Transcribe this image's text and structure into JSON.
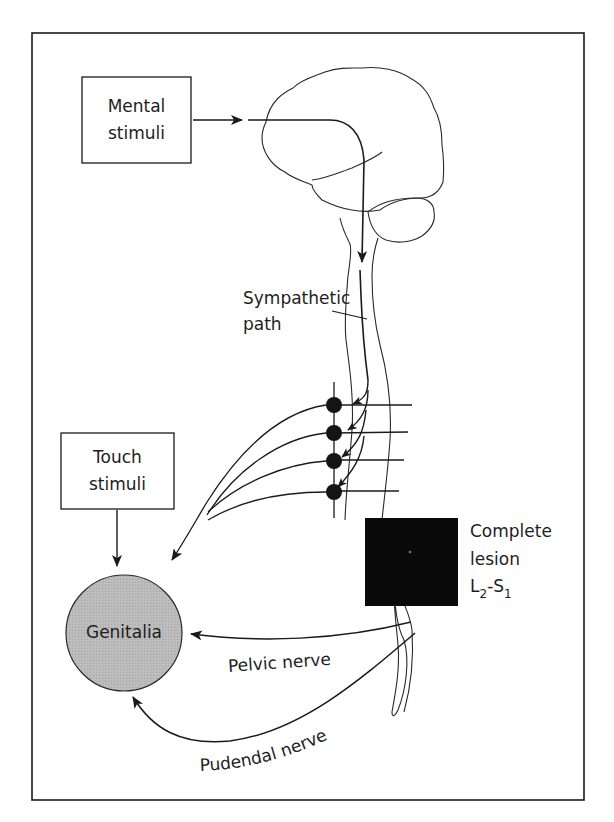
{
  "diagram": {
    "type": "neural-pathway-flow",
    "frame": {
      "x": 32,
      "y": 33,
      "width": 552,
      "height": 767
    },
    "colors": {
      "line": "#1a1a1a",
      "genitalia_fill": "#b9b9b9",
      "lesion_fill": "#0a0a0a",
      "background": "#ffffff"
    },
    "nodes": {
      "mental_stimuli": {
        "line1": "Mental",
        "line2": "stimuli"
      },
      "touch_stimuli": {
        "line1": "Touch",
        "line2": "stimuli"
      },
      "genitalia": {
        "label": "Genitalia"
      },
      "lesion": {
        "line1": "Complete",
        "line2": "lesion",
        "level_a": "L",
        "level_a_sub": "2",
        "dash": "-",
        "level_b": "S",
        "level_b_sub": "1"
      }
    },
    "labels": {
      "sympathetic_line1": "Sympathetic",
      "sympathetic_line2": "path",
      "pelvic_nerve": "Pelvic nerve",
      "pudendal_nerve": "Pudendal nerve"
    },
    "ganglia_count": 4,
    "edges": [
      {
        "from": "Mental stimuli",
        "to": "Brain"
      },
      {
        "from": "Brain",
        "to": "Spinal cord",
        "label": "Sympathetic path"
      },
      {
        "from": "Spinal cord",
        "to": "Sympathetic ganglia (x4)"
      },
      {
        "from": "Sympathetic ganglia",
        "to": "Genitalia"
      },
      {
        "from": "Touch stimuli",
        "to": "Genitalia"
      },
      {
        "from": "Sacral cord (below lesion L2-S1)",
        "to": "Genitalia",
        "label": "Pelvic nerve"
      },
      {
        "from": "Sacral cord (below lesion L2-S1)",
        "to": "Genitalia",
        "label": "Pudendal nerve"
      }
    ]
  }
}
